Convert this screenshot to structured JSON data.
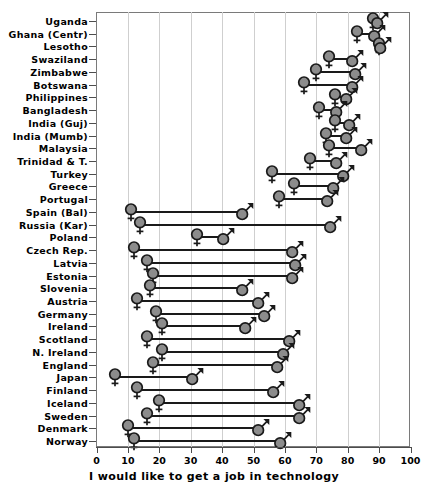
{
  "chart_data": {
    "type": "scatter",
    "subtype": "dumbbell",
    "title": "",
    "xlabel": "I would like to get a job in technology",
    "ylabel": "",
    "xlim": [
      0,
      100
    ],
    "xticks": [
      0,
      10,
      20,
      30,
      40,
      50,
      60,
      70,
      80,
      90,
      100
    ],
    "grid": "vertical",
    "legend": "none",
    "series": [
      {
        "name": "Female",
        "marker": "female-symbol"
      },
      {
        "name": "Male",
        "marker": "male-symbol"
      }
    ],
    "categories": [
      "Uganda",
      "Ghana (Centr)",
      "Lesotho",
      "Swaziland",
      "Zimbabwe",
      "Botswana",
      "Philippines",
      "Bangladesh",
      "India (Guj)",
      "India (Mumb)",
      "Malaysia",
      "Trinidad & T.",
      "Turkey",
      "Greece",
      "Portugal",
      "Spain (Bal)",
      "Russia (Kar)",
      "Poland",
      "Czech Rep.",
      "Latvia",
      "Estonia",
      "Slovenia",
      "Austria",
      "Germany",
      "Ireland",
      "Scotland",
      "N. Ireland",
      "England",
      "Japan",
      "Finland",
      "Iceland",
      "Sweden",
      "Denmark",
      "Norway"
    ],
    "points": [
      {
        "country": "Uganda",
        "female": 88,
        "male": 90
      },
      {
        "country": "Ghana (Centr)",
        "female": 83,
        "male": 89
      },
      {
        "country": "Lesotho",
        "female": 90,
        "male": 91
      },
      {
        "country": "Swaziland",
        "female": 74,
        "male": 82
      },
      {
        "country": "Zimbabwe",
        "female": 70,
        "male": 83
      },
      {
        "country": "Botswana",
        "female": 66,
        "male": 82
      },
      {
        "country": "Philippines",
        "female": 76,
        "male": 80
      },
      {
        "country": "Bangladesh",
        "female": 71,
        "male": 77
      },
      {
        "country": "India (Guj)",
        "female": 76,
        "male": 81
      },
      {
        "country": "India (Mumb)",
        "female": 73,
        "male": 80
      },
      {
        "country": "Malaysia",
        "female": 74,
        "male": 85
      },
      {
        "country": "Trinidad & T.",
        "female": 68,
        "male": 77
      },
      {
        "country": "Turkey",
        "female": 56,
        "male": 79
      },
      {
        "country": "Greece",
        "female": 63,
        "male": 76
      },
      {
        "country": "Portugal",
        "female": 58,
        "male": 74
      },
      {
        "country": "Spain (Bal)",
        "female": 11,
        "male": 47
      },
      {
        "country": "Russia (Kar)",
        "female": 14,
        "male": 75
      },
      {
        "country": "Poland",
        "female": 32,
        "male": 41
      },
      {
        "country": "Czech Rep.",
        "female": 12,
        "male": 63
      },
      {
        "country": "Latvia",
        "female": 16,
        "male": 64
      },
      {
        "country": "Estonia",
        "female": 18,
        "male": 63
      },
      {
        "country": "Slovenia",
        "female": 17,
        "male": 47
      },
      {
        "country": "Austria",
        "female": 13,
        "male": 52
      },
      {
        "country": "Germany",
        "female": 19,
        "male": 54
      },
      {
        "country": "Ireland",
        "female": 21,
        "male": 48
      },
      {
        "country": "Scotland",
        "female": 16,
        "male": 62
      },
      {
        "country": "N. Ireland",
        "female": 21,
        "male": 60
      },
      {
        "country": "England",
        "female": 18,
        "male": 58
      },
      {
        "country": "Japan",
        "female": 6,
        "male": 31
      },
      {
        "country": "Finland",
        "female": 13,
        "male": 57
      },
      {
        "country": "Iceland",
        "female": 20,
        "male": 65
      },
      {
        "country": "Sweden",
        "female": 16,
        "male": 65
      },
      {
        "country": "Denmark",
        "female": 10,
        "male": 52
      },
      {
        "country": "Norway",
        "female": 12,
        "male": 59
      }
    ]
  },
  "colors": {
    "marker_fill": "#8c8c8c",
    "marker_stroke": "#1a1a1a",
    "connector": "#1a1a1a",
    "gridline": "#cfcfcf",
    "axis": "#4d4d4d",
    "text": "#000000",
    "background": "#ffffff"
  }
}
